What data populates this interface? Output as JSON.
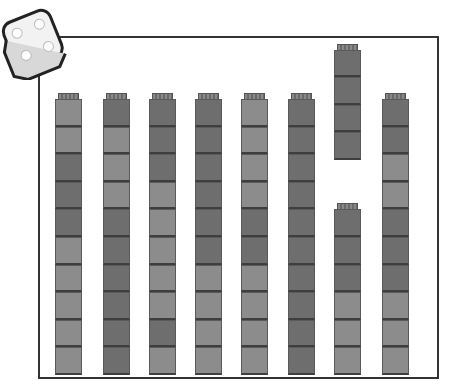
{
  "figure": {
    "die": {
      "face_pips": 4
    },
    "stacks": [
      {
        "label": "stack-1",
        "cubes": [
          "light",
          "light",
          "dark",
          "dark",
          "dark",
          "light",
          "light",
          "light",
          "light",
          "light"
        ]
      },
      {
        "label": "stack-2",
        "cubes": [
          "dark",
          "light",
          "light",
          "light",
          "dark",
          "dark",
          "dark",
          "dark",
          "dark",
          "dark"
        ]
      },
      {
        "label": "stack-3",
        "cubes": [
          "dark",
          "dark",
          "dark",
          "light",
          "light",
          "light",
          "light",
          "light",
          "dark",
          "light"
        ]
      },
      {
        "label": "stack-4",
        "cubes": [
          "dark",
          "dark",
          "dark",
          "dark",
          "dark",
          "dark",
          "light",
          "light",
          "light",
          "light"
        ]
      },
      {
        "label": "stack-5",
        "cubes": [
          "light",
          "light",
          "light",
          "light",
          "dark",
          "dark",
          "light",
          "light",
          "light",
          "light"
        ]
      },
      {
        "label": "stack-6",
        "cubes": [
          "dark",
          "dark",
          "dark",
          "dark",
          "dark",
          "dark",
          "dark",
          "dark",
          "dark",
          "dark"
        ]
      },
      {
        "label": "stack-7-top",
        "cubes": [
          "dark",
          "dark",
          "dark",
          "dark"
        ]
      },
      {
        "label": "stack-7-bottom",
        "cubes": [
          "dark",
          "dark",
          "dark",
          "light",
          "light",
          "light"
        ]
      },
      {
        "label": "stack-8",
        "cubes": [
          "dark",
          "dark",
          "light",
          "light",
          "dark",
          "dark",
          "dark",
          "light",
          "light",
          "light"
        ]
      }
    ],
    "colors": {
      "dark": "#6e6e6e",
      "light": "#8c8c8c",
      "frame": "#333333"
    }
  }
}
